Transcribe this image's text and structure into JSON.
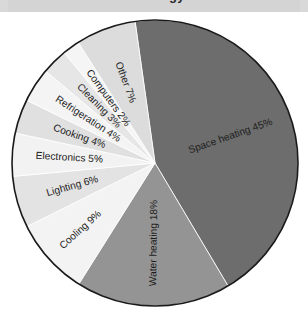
{
  "title": "Energy",
  "chart_data": {
    "type": "pie",
    "title": "Energy",
    "xlabel": "",
    "ylabel": "",
    "legend_position": "none",
    "grid": false,
    "units": "%",
    "total": 103,
    "categories": [
      "Space heating",
      "Water heating",
      "Cooling",
      "Lighting",
      "Electronics",
      "Cooking",
      "Refrigeration",
      "Cleaning",
      "Computers",
      "Other"
    ],
    "values": [
      45,
      18,
      9,
      6,
      5,
      4,
      4,
      3,
      2,
      7
    ],
    "labels": [
      "Space heating 45%",
      "Water heating 18%",
      "Cooling 9%",
      "Lighting 6%",
      "Electronics 5%",
      "Cooking 4%",
      "Refrigeration 4%",
      "Cleaning 3%",
      "Computers 2%",
      "Other 7%"
    ],
    "colors": [
      "#6d6d6d",
      "#949494",
      "#f3f3f3",
      "#e3e3e3",
      "#f2f2f2",
      "#e0e0e0",
      "#f4f4f4",
      "#e6e6e6",
      "#f5f5f5",
      "#dcdcdc"
    ],
    "label_text_colors": [
      "#ffffff",
      "#ffffff",
      "#1d1d1d",
      "#1d1d1d",
      "#1d1d1d",
      "#1d1d1d",
      "#1d1d1d",
      "#1d1d1d",
      "#1d1d1d",
      "#1d1d1d"
    ],
    "outline_color": "#1a1a1a",
    "background_color": "#ffffff"
  },
  "slices": [
    {
      "name": "space-heating",
      "label": "Space heating 45%",
      "value": 45,
      "color": "#6d6d6d",
      "text": "#ffffff"
    },
    {
      "name": "water-heating",
      "label": "Water heating 18%",
      "value": 18,
      "color": "#949494",
      "text": "#ffffff"
    },
    {
      "name": "cooling",
      "label": "Cooling 9%",
      "value": 9,
      "color": "#f3f3f3",
      "text": "#1d1d1d"
    },
    {
      "name": "lighting",
      "label": "Lighting 6%",
      "value": 6,
      "color": "#e3e3e3",
      "text": "#1d1d1d"
    },
    {
      "name": "electronics",
      "label": "Electronics 5%",
      "value": 5,
      "color": "#f2f2f2",
      "text": "#1d1d1d"
    },
    {
      "name": "cooking",
      "label": "Cooking 4%",
      "value": 4,
      "color": "#e0e0e0",
      "text": "#1d1d1d"
    },
    {
      "name": "refrigeration",
      "label": "Refrigeration 4%",
      "value": 4,
      "color": "#f4f4f4",
      "text": "#1d1d1d"
    },
    {
      "name": "cleaning",
      "label": "Cleaning 3%",
      "value": 3,
      "color": "#e6e6e6",
      "text": "#1d1d1d"
    },
    {
      "name": "computers",
      "label": "Computers 2%",
      "value": 2,
      "color": "#f5f5f5",
      "text": "#1d1d1d"
    },
    {
      "name": "other",
      "label": "Other 7%",
      "value": 7,
      "color": "#dcdcdc",
      "text": "#1d1d1d"
    }
  ],
  "geometry": {
    "cx": 155,
    "cy": 151,
    "r": 143,
    "start_angle": -8
  }
}
